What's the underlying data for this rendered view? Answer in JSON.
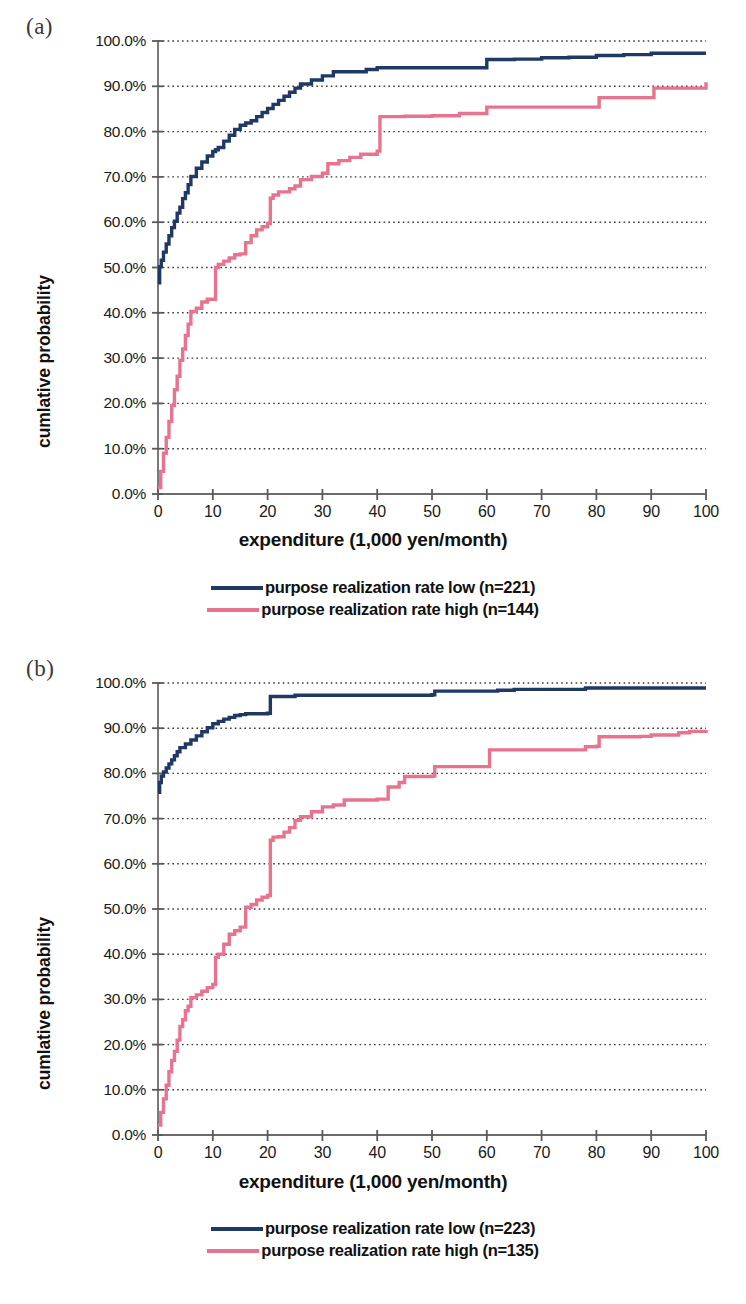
{
  "figure": {
    "panels": [
      {
        "label": "(a)",
        "axes": {
          "xlabel": "expenditure (1,000 yen/month)",
          "ylabel": "cumlative probability",
          "xticks": [
            "0",
            "10",
            "20",
            "30",
            "40",
            "50",
            "60",
            "70",
            "80",
            "90",
            "100"
          ],
          "yticks": [
            "0.0%",
            "10.0%",
            "20.0%",
            "30.0%",
            "40.0%",
            "50.0%",
            "60.0%",
            "70.0%",
            "80.0%",
            "90.0%",
            "100.0%"
          ]
        },
        "legend": [
          {
            "label": "purpose realization rate low (n=221)",
            "color": "#1f3864"
          },
          {
            "label": "purpose realization rate high (n=144)",
            "color": "#e8738f"
          }
        ]
      },
      {
        "label": "(b)",
        "axes": {
          "xlabel": "expenditure (1,000 yen/month)",
          "ylabel": "cumlative probability",
          "xticks": [
            "0",
            "10",
            "20",
            "30",
            "40",
            "50",
            "60",
            "70",
            "80",
            "90",
            "100"
          ],
          "yticks": [
            "0.0%",
            "10.0%",
            "20.0%",
            "30.0%",
            "40.0%",
            "50.0%",
            "60.0%",
            "70.0%",
            "80.0%",
            "90.0%",
            "100.0%"
          ]
        },
        "legend": [
          {
            "label": "purpose realization rate low (n=223)",
            "color": "#1f3864"
          },
          {
            "label": "purpose realization rate high (n=135)",
            "color": "#e8738f"
          }
        ]
      }
    ]
  },
  "chart_data": [
    {
      "type": "line",
      "title": "(a)",
      "xlabel": "expenditure (1,000 yen/month)",
      "ylabel": "cumlative probability",
      "xlim": [
        0,
        100
      ],
      "ylim": [
        0,
        100
      ],
      "xticks": [
        0,
        10,
        20,
        30,
        40,
        50,
        60,
        70,
        80,
        90,
        100
      ],
      "yticks": [
        0,
        10,
        20,
        30,
        40,
        50,
        60,
        70,
        80,
        90,
        100
      ],
      "grid": "horizontal-dotted",
      "legend_position": "below",
      "step": "post",
      "series": [
        {
          "name": "purpose realization rate low (n=221)",
          "color": "#1f3864",
          "n": 221,
          "x": [
            0,
            0.3,
            0.6,
            1,
            1.5,
            2,
            2.5,
            3,
            3.5,
            4,
            4.5,
            5,
            5.5,
            6,
            7,
            8,
            9,
            10,
            10.5,
            11,
            12,
            13,
            14,
            15,
            16,
            17,
            18,
            19,
            20,
            21,
            22,
            23,
            24,
            25,
            26,
            28,
            30,
            32,
            35,
            38,
            40,
            45,
            50,
            55,
            60,
            62,
            65,
            70,
            75,
            80,
            85,
            90,
            95,
            100
          ],
          "y": [
            46.6,
            50.2,
            51.6,
            53.4,
            55.2,
            57.0,
            58.8,
            60.2,
            62.0,
            63.3,
            65.2,
            66.5,
            68.3,
            70.1,
            71.9,
            73.3,
            74.6,
            75.6,
            76.0,
            76.5,
            77.9,
            79.2,
            80.5,
            81.4,
            81.9,
            82.4,
            83.3,
            84.2,
            85.1,
            86.0,
            86.9,
            87.8,
            88.7,
            89.6,
            90.5,
            91.4,
            92.3,
            93.2,
            93.2,
            93.7,
            94.1,
            94.1,
            94.1,
            94.1,
            95.9,
            95.9,
            96.0,
            96.3,
            96.4,
            96.8,
            97.0,
            97.3,
            97.3,
            97.3
          ]
        },
        {
          "name": "purpose realization rate high (n=144)",
          "color": "#e8738f",
          "n": 144,
          "x": [
            0,
            0.5,
            1,
            1.5,
            2,
            2.5,
            3,
            3.5,
            4,
            4.5,
            5,
            5.5,
            6,
            6.5,
            7,
            8,
            9,
            10,
            10.5,
            11,
            12,
            13,
            14,
            15,
            16,
            17,
            18,
            19,
            20,
            20.5,
            21,
            22,
            24,
            25,
            26,
            28,
            30,
            31,
            33,
            35,
            37,
            40,
            40.5,
            41,
            45,
            50,
            55,
            60,
            60.5,
            65,
            70,
            75,
            80,
            80.5,
            85,
            90,
            90.5,
            95,
            100
          ],
          "y": [
            1.4,
            5.0,
            9.0,
            12.5,
            16.0,
            19.5,
            23.0,
            26.0,
            29.5,
            32.0,
            35.0,
            37.5,
            40.3,
            40.3,
            41.0,
            42.4,
            43.0,
            43.0,
            50.0,
            50.7,
            51.4,
            52.1,
            52.8,
            53.0,
            55.5,
            57.0,
            58.3,
            59.0,
            59.7,
            65.3,
            66.0,
            66.7,
            67.4,
            68.0,
            69.4,
            70.1,
            70.8,
            72.9,
            73.6,
            74.3,
            75.0,
            75.7,
            83.3,
            83.3,
            83.4,
            83.5,
            84.0,
            85.4,
            85.4,
            85.4,
            85.4,
            85.4,
            85.4,
            87.5,
            87.5,
            87.5,
            89.6,
            89.6,
            90.9
          ]
        }
      ]
    },
    {
      "type": "line",
      "title": "(b)",
      "xlabel": "expenditure (1,000 yen/month)",
      "ylabel": "cumlative probability",
      "xlim": [
        0,
        100
      ],
      "ylim": [
        0,
        100
      ],
      "xticks": [
        0,
        10,
        20,
        30,
        40,
        50,
        60,
        70,
        80,
        90,
        100
      ],
      "yticks": [
        0,
        10,
        20,
        30,
        40,
        50,
        60,
        70,
        80,
        90,
        100
      ],
      "grid": "horizontal-dotted",
      "legend_position": "below",
      "step": "post",
      "series": [
        {
          "name": "purpose realization rate low (n=223)",
          "color": "#1f3864",
          "n": 223,
          "x": [
            0,
            0.3,
            0.6,
            1,
            1.5,
            2,
            2.5,
            3,
            3.5,
            4,
            5,
            6,
            7,
            8,
            9,
            10,
            11,
            12,
            13,
            14,
            15,
            16,
            17,
            18,
            19,
            20,
            20.5,
            21,
            22,
            24,
            25,
            30,
            35,
            40,
            45,
            50,
            50.5,
            55,
            60,
            62,
            65,
            70,
            75,
            78,
            80,
            85,
            90,
            95,
            100
          ],
          "y": [
            75.8,
            78.0,
            79.4,
            80.3,
            81.2,
            82.1,
            83.0,
            83.9,
            84.8,
            85.7,
            86.5,
            87.4,
            88.3,
            89.2,
            90.1,
            91.0,
            91.5,
            92.0,
            92.4,
            92.8,
            93.0,
            93.2,
            93.2,
            93.2,
            93.2,
            93.3,
            97.0,
            97.0,
            97.0,
            97.0,
            97.3,
            97.3,
            97.3,
            97.3,
            97.3,
            97.4,
            98.2,
            98.2,
            98.2,
            98.4,
            98.6,
            98.6,
            98.6,
            98.9,
            98.9,
            98.9,
            98.9,
            98.9,
            98.9
          ]
        },
        {
          "name": "purpose realization rate high (n=135)",
          "color": "#e8738f",
          "n": 135,
          "x": [
            0,
            0.5,
            1,
            1.5,
            2,
            2.5,
            3,
            3.5,
            4,
            4.5,
            5,
            5.5,
            6,
            7,
            8,
            9,
            10,
            10.5,
            11,
            12,
            13,
            14,
            15,
            16,
            17,
            18,
            19,
            20,
            20.5,
            21,
            22,
            23,
            24,
            25,
            26,
            28,
            30,
            32,
            34,
            35,
            38,
            40,
            42,
            44,
            45,
            48,
            50,
            50.5,
            55,
            60,
            60.5,
            65,
            70,
            75,
            78,
            80,
            80.5,
            85,
            88,
            90,
            95,
            97,
            100
          ],
          "y": [
            2.2,
            5.0,
            8.0,
            11.0,
            14.0,
            16.5,
            18.5,
            21.0,
            24.0,
            25.5,
            27.5,
            28.5,
            30.4,
            31.0,
            31.8,
            32.6,
            33.3,
            39.3,
            40.0,
            42.2,
            44.4,
            45.2,
            46.0,
            50.4,
            51.0,
            52.0,
            52.6,
            53.0,
            65.2,
            65.9,
            66.0,
            67.0,
            68.0,
            69.6,
            70.4,
            71.5,
            72.6,
            73.0,
            74.1,
            74.1,
            74.1,
            74.3,
            77.0,
            78.0,
            79.3,
            79.3,
            79.4,
            81.5,
            81.5,
            81.5,
            85.2,
            85.2,
            85.2,
            85.2,
            85.9,
            86.0,
            88.1,
            88.1,
            88.2,
            88.5,
            89.0,
            89.3,
            89.6
          ]
        }
      ]
    }
  ]
}
